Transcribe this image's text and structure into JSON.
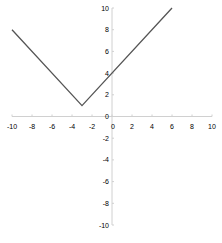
{
  "chart_data": {
    "type": "line",
    "title": "",
    "xlabel": "",
    "ylabel": "",
    "xlim": [
      -10,
      10
    ],
    "ylim": [
      -10,
      10
    ],
    "grid": false,
    "legend": null,
    "x_ticks": [
      -10,
      -8,
      -6,
      -4,
      -2,
      0,
      2,
      4,
      6,
      8,
      10
    ],
    "y_ticks": [
      -10,
      -8,
      -6,
      -4,
      -2,
      0,
      2,
      4,
      6,
      8,
      10
    ],
    "series": [
      {
        "name": "y = |x + 3| + 1",
        "x": [
          -10,
          -3,
          6
        ],
        "y": [
          8,
          1,
          10
        ],
        "color": "#555555"
      }
    ]
  },
  "colors": {
    "axis": "#d0d0d0",
    "line": "#555555",
    "text": "#000000"
  }
}
